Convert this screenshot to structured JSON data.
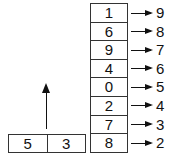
{
  "stack": {
    "cells": [
      {
        "value": "1",
        "target": "9"
      },
      {
        "value": "6",
        "target": "8"
      },
      {
        "value": "9",
        "target": "7"
      },
      {
        "value": "4",
        "target": "6"
      },
      {
        "value": "0",
        "target": "5"
      },
      {
        "value": "2",
        "target": "4"
      },
      {
        "value": "7",
        "target": "3"
      },
      {
        "value": "8",
        "target": "2"
      }
    ]
  },
  "pair": {
    "left": "5",
    "right": "3"
  }
}
